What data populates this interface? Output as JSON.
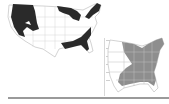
{
  "maps": [
    {
      "id": "left",
      "description": "Contiguous United States outline with selected regions shaded black",
      "shade_color": "#2a2a2a",
      "outline_color": "#c8c8c8",
      "shaded_regions": [
        "Pacific Northwest / West Coast",
        "Upper Midwest / Great Lakes",
        "New England / Appalachia",
        "Gulf Coast / Southeast"
      ]
    },
    {
      "id": "right",
      "description": "Eastern United States with states shaded gray",
      "shade_color": "#8e8e8e",
      "outline_color": "#c8c8c8",
      "shaded_regions": [
        "Great Lakes",
        "Northeast",
        "Mid-Atlantic",
        "Southeast"
      ]
    }
  ],
  "colors": {
    "background": "#ffffff",
    "rule": "#9a9a9a",
    "divider": "#d8d8d8"
  }
}
